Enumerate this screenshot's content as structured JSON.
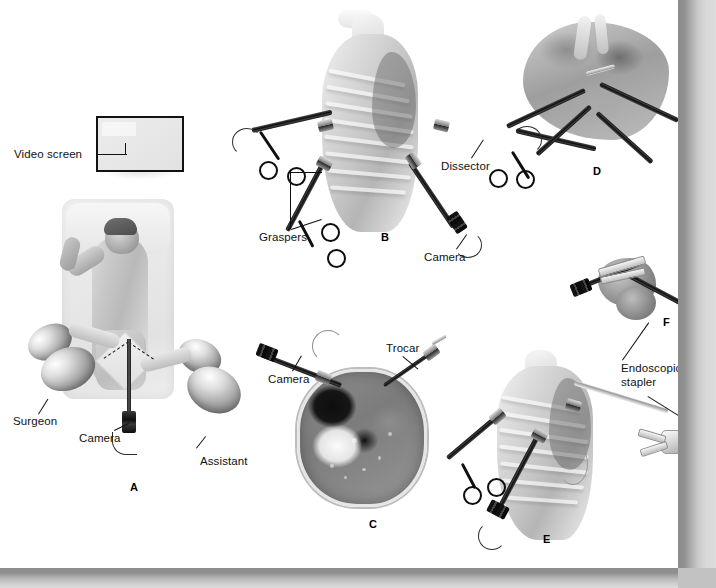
{
  "figure": {
    "style": "grayscale medical illustration",
    "background_color": "#ffffff",
    "shadow_color": "#8d8d8d"
  },
  "panels": [
    {
      "id": "A",
      "letter": "A",
      "caption": "Operating room setup with patient in lateral decubitus position",
      "labels": [
        {
          "text": "Video screen",
          "name": "video-screen-label"
        },
        {
          "text": "Surgeon",
          "name": "surgeon-label"
        },
        {
          "text": "Camera",
          "name": "camera-label-a"
        },
        {
          "text": "Assistant",
          "name": "assistant-label"
        }
      ]
    },
    {
      "id": "B",
      "letter": "B",
      "caption": "Port placement on the chest wall with instruments inserted",
      "labels": [
        {
          "text": "Graspers",
          "name": "graspers-label"
        },
        {
          "text": "Dissector",
          "name": "dissector-label"
        },
        {
          "text": "Camera",
          "name": "camera-label-b"
        }
      ]
    },
    {
      "id": "C",
      "letter": "C",
      "caption": "Axial cross-section showing camera and trocar entry",
      "labels": [
        {
          "text": "Camera",
          "name": "camera-label-c"
        },
        {
          "text": "Trocar",
          "name": "trocar-label"
        }
      ]
    },
    {
      "id": "D",
      "letter": "D",
      "caption": "Intraoperative hilar dissection view",
      "labels": []
    },
    {
      "id": "E",
      "letter": "E",
      "caption": "Endoscopic stapler introduced through the chest wall port",
      "labels": [
        {
          "text": "Endoscopic stapler",
          "name": "endoscopic-stapler-label-e"
        }
      ]
    },
    {
      "id": "F",
      "letter": "F",
      "caption": "Stapler applied across the vascular pedicle",
      "labels": [
        {
          "text": "Endoscopic stapler",
          "name": "endoscopic-stapler-label-f"
        }
      ]
    }
  ],
  "labels": {
    "video_screen": "Video screen",
    "surgeon": "Surgeon",
    "assistant": "Assistant",
    "camera_a": "Camera",
    "camera_b": "Camera",
    "camera_c": "Camera",
    "graspers": "Graspers",
    "dissector": "Dissector",
    "trocar": "Trocar",
    "endoscopic_stapler_line1": "Endoscopic",
    "endoscopic_stapler_line2": "stapler",
    "endoscopic_stapler_e_line1": "Endoscopic",
    "endoscopic_stapler_e_line2": "stapler"
  },
  "panel_letters": {
    "a": "A",
    "b": "B",
    "c": "C",
    "d": "D",
    "e": "E",
    "f": "F"
  }
}
